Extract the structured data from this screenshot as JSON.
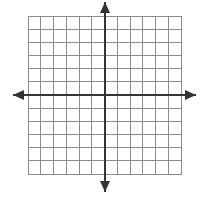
{
  "figure": {
    "title": "Blank Cartesian coordinate grid with arrowed x-axis and y-axis",
    "type": "coordinate-grid",
    "canvas": {
      "width": 202,
      "height": 197,
      "background": "#ffffff"
    }
  },
  "grid": {
    "columns": 12,
    "rows": 12,
    "cell_width": 12.75,
    "cell_height": 13.17,
    "left": 28,
    "top": 16,
    "right": 181,
    "bottom": 174,
    "line_color": "#8c8c8c",
    "line_width": 1,
    "border_color": "#8c8c8c",
    "border_width": 1
  },
  "axes": {
    "color": "#333333",
    "line_width": 2,
    "origin": {
      "x": 105,
      "y": 95
    },
    "x_axis": {
      "name": "x-axis",
      "orientation": "horizontal",
      "y": 95,
      "start_x": 13,
      "end_x": 196,
      "arrows": [
        "left",
        "right"
      ]
    },
    "y_axis": {
      "name": "y-axis",
      "orientation": "vertical",
      "x": 105,
      "start_y": 2,
      "end_y": 192,
      "arrows": [
        "up",
        "down"
      ]
    }
  },
  "arrowheads": {
    "color": "#333333",
    "length": 11,
    "half_width": 5,
    "up": {
      "tip_x": 105,
      "tip_y": 2
    },
    "down": {
      "tip_x": 105,
      "tip_y": 192
    },
    "left": {
      "tip_x": 13,
      "tip_y": 95
    },
    "right": {
      "tip_x": 196,
      "tip_y": 95
    }
  },
  "labels": {
    "tick_labels": [],
    "axis_titles": [],
    "note": "no numeric labels are printed on this grid"
  },
  "chart_data": {
    "type": "grid",
    "title": "",
    "xlabel": "",
    "ylabel": "",
    "xlim": [
      -6,
      6
    ],
    "ylim": [
      -6,
      6
    ],
    "xticks": [
      -6,
      -5,
      -4,
      -3,
      -2,
      -1,
      0,
      1,
      2,
      3,
      4,
      5,
      6
    ],
    "yticks": [
      -6,
      -5,
      -4,
      -3,
      -2,
      -1,
      0,
      1,
      2,
      3,
      4,
      5,
      6
    ],
    "tick_labels_shown": false,
    "grid": true,
    "legend": null,
    "series": [],
    "annotations": []
  }
}
